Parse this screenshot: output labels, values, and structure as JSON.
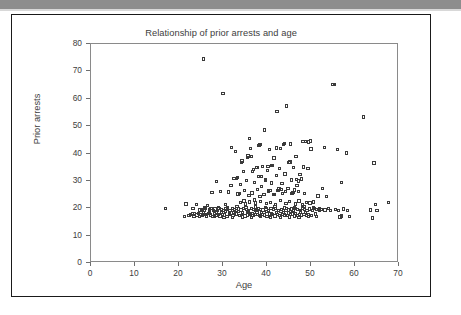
{
  "figure": {
    "title": "Relationship of prior arrests and age",
    "x_axis_title": "Age",
    "y_axis_title": "Prior arrests",
    "frame_color": "#1a1a1a",
    "axis_color": "#8a8a8a",
    "marker_color": "#3a3a3a",
    "top_bar_color": "#8d8d8d"
  },
  "chart_data": {
    "type": "scatter",
    "title": "Relationship of prior arrests and age",
    "xlabel": "Age",
    "ylabel": "Prior arrests",
    "xlim": [
      0,
      70
    ],
    "ylim": [
      0,
      80
    ],
    "xticks": [
      0,
      10,
      20,
      30,
      40,
      50,
      60,
      70
    ],
    "yticks": [
      0,
      10,
      20,
      30,
      40,
      50,
      60,
      70,
      80
    ],
    "grid": false,
    "legend": null,
    "marker": "open-square",
    "series": [
      {
        "name": "offenders",
        "points": [
          [
            17.0,
            19.8
          ],
          [
            21.2,
            16.9
          ],
          [
            21.6,
            21.5
          ],
          [
            22.3,
            17.4
          ],
          [
            22.6,
            17.6
          ],
          [
            23.0,
            18.1
          ],
          [
            23.4,
            17.2
          ],
          [
            23.6,
            17.9
          ],
          [
            23.9,
            21.3
          ],
          [
            24.1,
            17.5
          ],
          [
            24.4,
            18.2
          ],
          [
            24.6,
            17.1
          ],
          [
            24.8,
            19.4
          ],
          [
            25.0,
            17.8
          ],
          [
            25.2,
            19.6
          ],
          [
            25.4,
            17.3
          ],
          [
            25.6,
            74.5
          ],
          [
            25.7,
            19.1
          ],
          [
            25.9,
            17.6
          ],
          [
            26.1,
            19.9
          ],
          [
            26.3,
            17.2
          ],
          [
            26.5,
            21.0
          ],
          [
            26.7,
            18.0
          ],
          [
            26.9,
            19.5
          ],
          [
            27.1,
            17.5
          ],
          [
            27.3,
            19.8
          ],
          [
            27.5,
            25.8
          ],
          [
            27.6,
            17.1
          ],
          [
            27.8,
            19.3
          ],
          [
            28.0,
            17.9
          ],
          [
            28.2,
            19.7
          ],
          [
            28.4,
            17.4
          ],
          [
            28.6,
            29.8
          ],
          [
            28.7,
            19.2
          ],
          [
            28.9,
            17.6
          ],
          [
            29.1,
            19.9
          ],
          [
            29.3,
            17.2
          ],
          [
            29.5,
            26.1
          ],
          [
            29.7,
            19.5
          ],
          [
            29.9,
            17.8
          ],
          [
            30.0,
            61.8
          ],
          [
            30.1,
            19.3
          ],
          [
            30.3,
            17.5
          ],
          [
            30.5,
            21.4
          ],
          [
            30.7,
            19.8
          ],
          [
            30.9,
            17.1
          ],
          [
            31.1,
            19.6
          ],
          [
            31.3,
            25.9
          ],
          [
            31.5,
            17.7
          ],
          [
            31.6,
            19.2
          ],
          [
            31.8,
            28.3
          ],
          [
            32.0,
            42.3
          ],
          [
            32.1,
            19.9
          ],
          [
            32.3,
            17.4
          ],
          [
            32.5,
            30.8
          ],
          [
            32.6,
            19.5
          ],
          [
            32.8,
            40.7
          ],
          [
            33.0,
            17.9
          ],
          [
            33.1,
            19.1
          ],
          [
            33.3,
            31.2
          ],
          [
            33.4,
            25.2
          ],
          [
            33.6,
            19.7
          ],
          [
            33.7,
            17.3
          ],
          [
            33.9,
            28.6
          ],
          [
            34.0,
            22.0
          ],
          [
            34.1,
            19.4
          ],
          [
            34.3,
            37.3
          ],
          [
            34.4,
            17.8
          ],
          [
            34.6,
            33.5
          ],
          [
            34.7,
            19.9
          ],
          [
            34.9,
            26.4
          ],
          [
            35.0,
            17.2
          ],
          [
            35.1,
            21.6
          ],
          [
            35.3,
            19.6
          ],
          [
            35.4,
            30.1
          ],
          [
            35.6,
            17.5
          ],
          [
            35.7,
            39.1
          ],
          [
            35.8,
            19.3
          ],
          [
            36.0,
            45.6
          ],
          [
            36.1,
            22.3
          ],
          [
            36.2,
            17.9
          ],
          [
            36.4,
            38.8
          ],
          [
            36.5,
            19.8
          ],
          [
            36.6,
            25.6
          ],
          [
            36.8,
            17.4
          ],
          [
            36.9,
            34.1
          ],
          [
            37.0,
            19.5
          ],
          [
            37.1,
            29.4
          ],
          [
            37.3,
            17.7
          ],
          [
            37.4,
            21.9
          ],
          [
            37.5,
            19.2
          ],
          [
            37.6,
            35.0
          ],
          [
            37.8,
            17.6
          ],
          [
            37.9,
            26.8
          ],
          [
            38.0,
            19.9
          ],
          [
            38.1,
            31.7
          ],
          [
            38.3,
            17.3
          ],
          [
            38.4,
            43.3
          ],
          [
            38.5,
            22.5
          ],
          [
            38.6,
            19.6
          ],
          [
            38.8,
            28.0
          ],
          [
            38.9,
            17.8
          ],
          [
            39.0,
            35.3
          ],
          [
            39.1,
            19.4
          ],
          [
            39.3,
            25.1
          ],
          [
            39.4,
            48.6
          ],
          [
            39.5,
            17.5
          ],
          [
            39.6,
            30.6
          ],
          [
            39.8,
            19.7
          ],
          [
            39.9,
            21.8
          ],
          [
            40.0,
            17.1
          ],
          [
            40.1,
            33.8
          ],
          [
            40.3,
            19.3
          ],
          [
            40.4,
            26.3
          ],
          [
            40.5,
            41.4
          ],
          [
            40.6,
            17.9
          ],
          [
            40.8,
            22.1
          ],
          [
            40.9,
            19.8
          ],
          [
            41.0,
            35.5
          ],
          [
            41.1,
            29.2
          ],
          [
            41.3,
            17.6
          ],
          [
            41.4,
            19.5
          ],
          [
            41.5,
            24.9
          ],
          [
            41.6,
            38.4
          ],
          [
            41.8,
            17.2
          ],
          [
            41.9,
            21.4
          ],
          [
            42.0,
            19.9
          ],
          [
            42.1,
            31.9
          ],
          [
            42.3,
            55.4
          ],
          [
            42.4,
            17.7
          ],
          [
            42.5,
            26.6
          ],
          [
            42.6,
            19.1
          ],
          [
            42.8,
            34.4
          ],
          [
            42.9,
            17.4
          ],
          [
            43.0,
            41.7
          ],
          [
            43.1,
            22.8
          ],
          [
            43.3,
            19.6
          ],
          [
            43.4,
            29.0
          ],
          [
            43.5,
            17.8
          ],
          [
            43.6,
            25.3
          ],
          [
            43.8,
            19.2
          ],
          [
            43.9,
            43.6
          ],
          [
            44.0,
            17.5
          ],
          [
            44.1,
            32.5
          ],
          [
            44.3,
            21.7
          ],
          [
            44.4,
            19.9
          ],
          [
            44.5,
            57.4
          ],
          [
            44.6,
            17.3
          ],
          [
            44.8,
            27.1
          ],
          [
            44.9,
            19.4
          ],
          [
            45.0,
            36.7
          ],
          [
            45.1,
            22.4
          ],
          [
            45.3,
            17.6
          ],
          [
            45.4,
            43.5
          ],
          [
            45.5,
            19.7
          ],
          [
            45.6,
            30.3
          ],
          [
            45.8,
            17.9
          ],
          [
            45.9,
            25.7
          ],
          [
            46.0,
            19.3
          ],
          [
            46.1,
            34.8
          ],
          [
            46.3,
            17.2
          ],
          [
            46.4,
            21.5
          ],
          [
            46.5,
            19.8
          ],
          [
            46.6,
            38.9
          ],
          [
            46.8,
            28.2
          ],
          [
            46.9,
            17.4
          ],
          [
            47.0,
            19.5
          ],
          [
            47.1,
            26.0
          ],
          [
            47.3,
            22.6
          ],
          [
            47.4,
            17.7
          ],
          [
            47.5,
            32.2
          ],
          [
            47.6,
            19.1
          ],
          [
            47.8,
            30.7
          ],
          [
            47.9,
            17.5
          ],
          [
            48.0,
            21.2
          ],
          [
            48.1,
            19.9
          ],
          [
            48.3,
            35.1
          ],
          [
            48.4,
            17.8
          ],
          [
            48.5,
            25.5
          ],
          [
            48.6,
            19.6
          ],
          [
            48.8,
            44.5
          ],
          [
            48.9,
            17.3
          ],
          [
            49.0,
            22.0
          ],
          [
            49.1,
            19.2
          ],
          [
            49.3,
            34.6
          ],
          [
            49.4,
            17.6
          ],
          [
            49.5,
            44.2
          ],
          [
            49.6,
            19.7
          ],
          [
            49.8,
            21.9
          ],
          [
            50.0,
            41.6
          ],
          [
            50.1,
            17.4
          ],
          [
            50.3,
            19.3
          ],
          [
            50.5,
            22.3
          ],
          [
            50.8,
            19.8
          ],
          [
            51.0,
            17.9
          ],
          [
            51.3,
            19.5
          ],
          [
            51.6,
            24.5
          ],
          [
            51.9,
            19.1
          ],
          [
            52.3,
            19.6
          ],
          [
            52.6,
            27.3
          ],
          [
            53.0,
            42.1
          ],
          [
            53.2,
            19.4
          ],
          [
            53.6,
            24.3
          ],
          [
            54.0,
            19.8
          ],
          [
            54.5,
            19.2
          ],
          [
            55.0,
            65.2
          ],
          [
            55.4,
            65.3
          ],
          [
            55.6,
            19.6
          ],
          [
            56.0,
            41.4
          ],
          [
            56.3,
            19.3
          ],
          [
            56.6,
            16.8
          ],
          [
            56.9,
            17.2
          ],
          [
            57.0,
            29.5
          ],
          [
            57.4,
            19.7
          ],
          [
            58.0,
            40.2
          ],
          [
            58.3,
            19.1
          ],
          [
            58.8,
            17.1
          ],
          [
            61.9,
            53.3
          ],
          [
            63.6,
            19.4
          ],
          [
            64.0,
            16.4
          ],
          [
            64.3,
            36.5
          ],
          [
            64.6,
            21.3
          ],
          [
            65.0,
            19.2
          ],
          [
            67.6,
            22.1
          ],
          [
            33.0,
            30.9
          ],
          [
            34.2,
            36.8
          ],
          [
            35.5,
            38.6
          ],
          [
            36.3,
            41.9
          ],
          [
            38.2,
            42.8
          ],
          [
            40.2,
            35.2
          ],
          [
            41.2,
            35.6
          ],
          [
            42.2,
            42.0
          ],
          [
            43.7,
            43.4
          ],
          [
            45.2,
            36.9
          ],
          [
            46.7,
            30.5
          ],
          [
            48.2,
            44.3
          ],
          [
            49.9,
            44.6
          ],
          [
            36.7,
            33.4
          ],
          [
            37.7,
            34.9
          ],
          [
            38.7,
            31.5
          ],
          [
            39.7,
            30.2
          ],
          [
            40.7,
            26.5
          ],
          [
            41.7,
            25.0
          ],
          [
            42.7,
            27.0
          ],
          [
            43.2,
            26.9
          ],
          [
            44.2,
            26.2
          ],
          [
            45.7,
            25.4
          ],
          [
            46.2,
            26.7
          ],
          [
            47.2,
            29.9
          ],
          [
            33.8,
            25.4
          ],
          [
            34.8,
            22.7
          ],
          [
            35.9,
            24.6
          ],
          [
            37.2,
            23.0
          ],
          [
            38.4,
            24.2
          ],
          [
            26.0,
            17.7
          ],
          [
            27.0,
            18.3
          ],
          [
            28.5,
            18.6
          ],
          [
            29.6,
            18.4
          ],
          [
            30.6,
            18.8
          ],
          [
            31.4,
            18.2
          ],
          [
            32.4,
            18.5
          ],
          [
            33.5,
            18.7
          ],
          [
            34.5,
            18.3
          ],
          [
            35.5,
            18.9
          ],
          [
            36.6,
            18.1
          ],
          [
            37.7,
            18.6
          ],
          [
            38.8,
            18.4
          ],
          [
            39.9,
            18.8
          ],
          [
            41.0,
            18.2
          ],
          [
            42.1,
            18.5
          ],
          [
            43.2,
            18.7
          ],
          [
            44.3,
            18.3
          ],
          [
            45.4,
            18.9
          ],
          [
            46.5,
            18.1
          ],
          [
            47.6,
            18.6
          ],
          [
            48.7,
            18.4
          ],
          [
            24.5,
            18.0
          ],
          [
            25.5,
            18.5
          ],
          [
            29.0,
            20.1
          ],
          [
            31.0,
            20.3
          ],
          [
            33.2,
            20.6
          ],
          [
            35.2,
            20.2
          ],
          [
            37.4,
            20.5
          ],
          [
            39.6,
            20.4
          ],
          [
            41.8,
            20.7
          ],
          [
            44.0,
            20.1
          ],
          [
            46.2,
            20.3
          ],
          [
            48.4,
            20.6
          ],
          [
            50.6,
            20.2
          ],
          [
            52.0,
            19.9
          ],
          [
            23.2,
            20.0
          ],
          [
            25.8,
            20.4
          ],
          [
            28.1,
            16.9
          ],
          [
            30.2,
            16.7
          ],
          [
            32.2,
            16.6
          ],
          [
            34.4,
            16.8
          ],
          [
            36.5,
            16.5
          ],
          [
            38.6,
            16.9
          ],
          [
            40.8,
            16.7
          ],
          [
            43.0,
            16.6
          ],
          [
            45.1,
            16.8
          ],
          [
            47.3,
            16.5
          ],
          [
            49.4,
            16.9
          ],
          [
            51.2,
            17.0
          ]
        ]
      }
    ]
  }
}
